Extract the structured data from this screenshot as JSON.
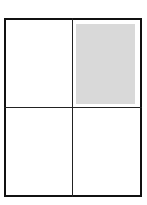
{
  "diagram": {
    "type": "grid",
    "rows": 2,
    "columns": 2,
    "cells": [
      {
        "position": "top-left",
        "shaded": false
      },
      {
        "position": "top-right",
        "shaded": true
      },
      {
        "position": "bottom-left",
        "shaded": false
      },
      {
        "position": "bottom-right",
        "shaded": false
      }
    ],
    "colors": {
      "border": "#111111",
      "divider": "#222222",
      "shade": "#d9d9d9",
      "background": "#ffffff"
    }
  }
}
